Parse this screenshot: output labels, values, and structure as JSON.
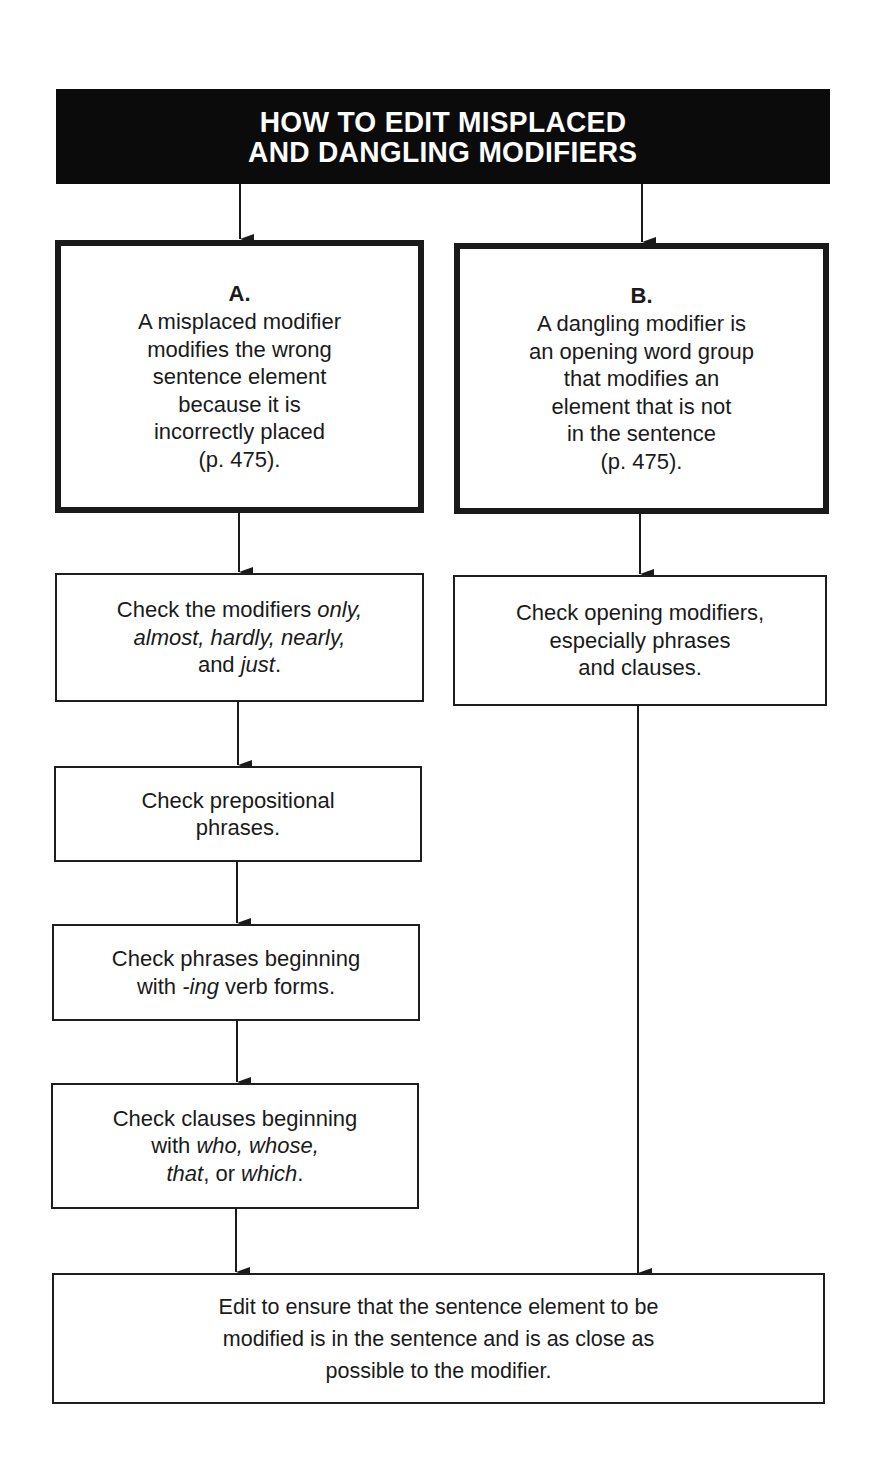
{
  "title": {
    "lines": [
      "HOW TO EDIT MISPLACED",
      "AND DANGLING MODIFIERS"
    ],
    "background": "#0b0b0b",
    "text_color": "#ffffff"
  },
  "branch_a": {
    "letter": "A.",
    "lines": [
      "A misplaced modifier",
      "modifies the wrong",
      "sentence element",
      "because it is",
      "incorrectly placed",
      "(p. 475)."
    ]
  },
  "branch_b": {
    "letter": "B.",
    "lines": [
      "A dangling modifier is",
      "an opening word group",
      "that modifies an",
      "element that is not",
      "in the sentence",
      "(p. 475)."
    ]
  },
  "steps_a": [
    {
      "lines": [
        [
          {
            "t": "Check the modifiers ",
            "i": false
          },
          {
            "t": "only,",
            "i": true
          }
        ],
        [
          {
            "t": "almost, hardly, nearly,",
            "i": true
          }
        ],
        [
          {
            "t": "and ",
            "i": false
          },
          {
            "t": "just",
            "i": true
          },
          {
            "t": ".",
            "i": false
          }
        ]
      ]
    },
    {
      "lines": [
        [
          {
            "t": "Check prepositional",
            "i": false
          }
        ],
        [
          {
            "t": "phrases.",
            "i": false
          }
        ]
      ]
    },
    {
      "lines": [
        [
          {
            "t": "Check phrases beginning",
            "i": false
          }
        ],
        [
          {
            "t": "with ",
            "i": false
          },
          {
            "t": "-ing",
            "i": true
          },
          {
            "t": " verb forms.",
            "i": false
          }
        ]
      ]
    },
    {
      "lines": [
        [
          {
            "t": "Check clauses beginning",
            "i": false
          }
        ],
        [
          {
            "t": "with ",
            "i": false
          },
          {
            "t": "who, whose,",
            "i": true
          }
        ],
        [
          {
            "t": "that",
            "i": true
          },
          {
            "t": ", or ",
            "i": false
          },
          {
            "t": "which",
            "i": true
          },
          {
            "t": ".",
            "i": false
          }
        ]
      ]
    }
  ],
  "steps_b": [
    {
      "lines": [
        [
          {
            "t": "Check opening modifiers,",
            "i": false
          }
        ],
        [
          {
            "t": "especially phrases",
            "i": false
          }
        ],
        [
          {
            "t": "and clauses.",
            "i": false
          }
        ]
      ]
    }
  ],
  "final": {
    "lines": [
      "Edit to ensure that the sentence element to be",
      "modified is in the sentence and is as close as",
      "possible to the modifier."
    ]
  }
}
